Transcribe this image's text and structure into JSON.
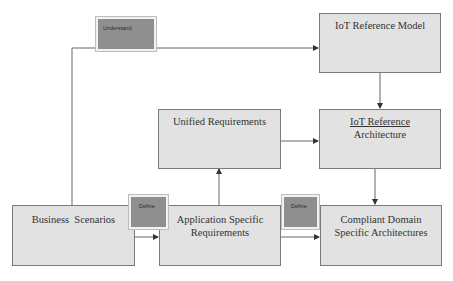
{
  "diagram": {
    "nodes": {
      "iot_reference_model": {
        "label": "IoT Reference Model"
      },
      "iot_reference_architecture": {
        "line1": "IoT Reference",
        "line2": "Architecture"
      },
      "unified_requirements": {
        "label": "Unified Requirements"
      },
      "business_scenarios": {
        "label": "Business  Scenarios"
      },
      "application_specific_requirements": {
        "line1": "Application Specific",
        "line2": "Requirements"
      },
      "compliant_domain_specific_architectures": {
        "line1": "Compliant Domain",
        "line2": "Specific Architectures"
      }
    },
    "tags": {
      "understand": "Understand",
      "define_1": "Define",
      "define_2": "Define"
    },
    "edges": [
      {
        "from": "business_scenarios",
        "to": "iot_reference_model",
        "label": "Understand"
      },
      {
        "from": "iot_reference_model",
        "to": "iot_reference_architecture"
      },
      {
        "from": "unified_requirements",
        "to": "iot_reference_architecture"
      },
      {
        "from": "application_specific_requirements",
        "to": "unified_requirements"
      },
      {
        "from": "business_scenarios",
        "to": "application_specific_requirements",
        "label": "Define"
      },
      {
        "from": "application_specific_requirements",
        "to": "compliant_domain_specific_architectures",
        "label": "Define"
      },
      {
        "from": "iot_reference_architecture",
        "to": "compliant_domain_specific_architectures"
      }
    ],
    "colors": {
      "box_fill": "#e2e2e2",
      "box_border": "#7a7a7a",
      "tag_fill": "#8f8f8f",
      "line": "#555555"
    }
  }
}
